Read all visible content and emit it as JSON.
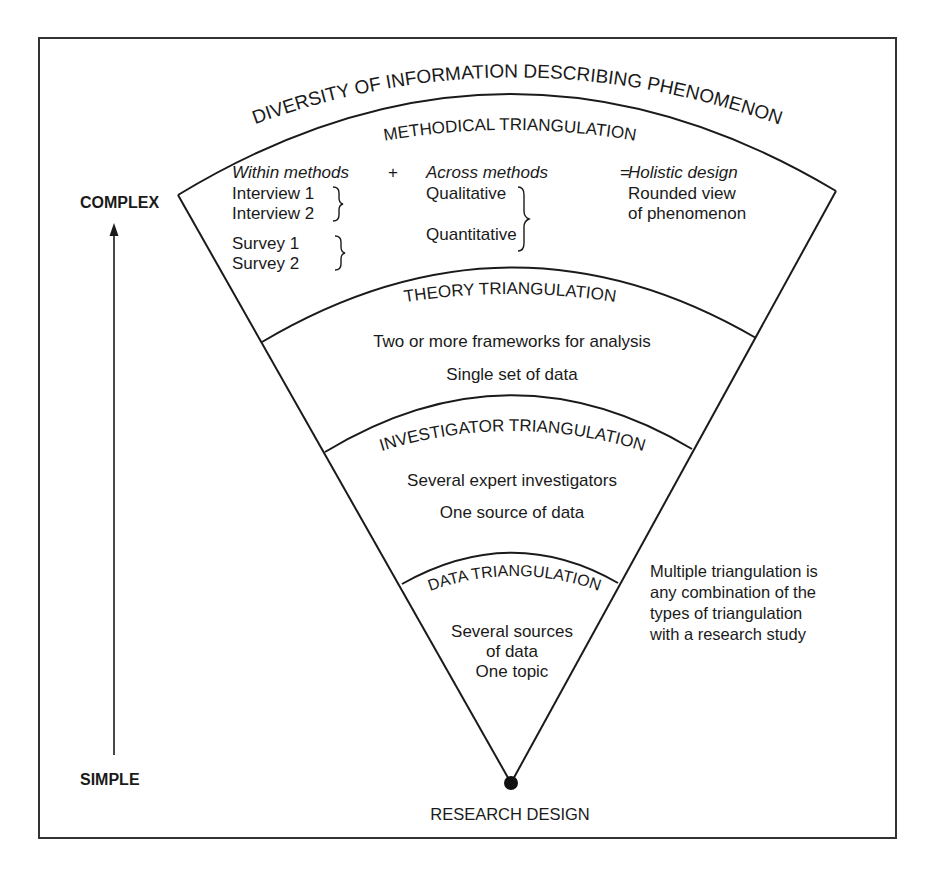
{
  "diagram": {
    "outer_title": "DIVERSITY OF INFORMATION DESCRIBING PHENOMENON",
    "axis": {
      "top_label": "COMPLEX",
      "bottom_label": "SIMPLE"
    },
    "apex_label": "RESEARCH DESIGN",
    "side_note": [
      "Multiple triangulation is",
      "any combination of the",
      "types of triangulation",
      "with a research study"
    ],
    "bands": {
      "methodical": {
        "title": "METHODICAL TRIANGULATION",
        "within_header": "Within methods",
        "plus": "+",
        "across_header": "Across methods",
        "equals": "=",
        "holistic_header": "Holistic design",
        "within_items": [
          "Interview 1",
          "Interview 2",
          "Survey 1",
          "Survey 2"
        ],
        "across_items": [
          "Qualitative",
          "Quantitative"
        ],
        "holistic_lines": [
          "Rounded view",
          "of phenomenon"
        ]
      },
      "theory": {
        "title": "THEORY TRIANGULATION",
        "lines": [
          "Two or more frameworks for analysis",
          "Single set of data"
        ]
      },
      "investigator": {
        "title": "INVESTIGATOR TRIANGULATION",
        "lines": [
          "Several expert investigators",
          "One source of data"
        ]
      },
      "data": {
        "title": "DATA TRIANGULATION",
        "lines": [
          "Several sources",
          "of data",
          "One topic"
        ]
      }
    }
  }
}
